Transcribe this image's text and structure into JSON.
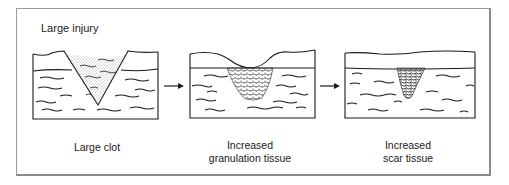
{
  "diagram": {
    "title": "Large injury",
    "stages": [
      {
        "id": "large-clot",
        "caption_lines": [
          "Large clot"
        ]
      },
      {
        "id": "granulation",
        "caption_lines": [
          "Increased",
          "granulation tissue"
        ]
      },
      {
        "id": "scar",
        "caption_lines": [
          "Increased",
          "scar tissue"
        ]
      }
    ],
    "arrows": [
      {
        "from": "large-clot",
        "to": "granulation"
      },
      {
        "from": "granulation",
        "to": "scar"
      }
    ],
    "colors": {
      "line": "#1a1a1a",
      "frame": "#8a8a8a",
      "stipple": "#555555"
    }
  }
}
